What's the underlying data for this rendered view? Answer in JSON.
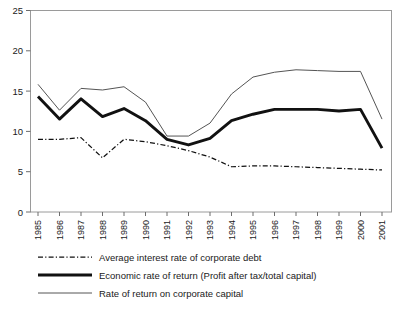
{
  "chart_data": {
    "type": "line",
    "title": "",
    "subtitle": "",
    "xlabel": "",
    "ylabel": "",
    "x": [
      1985,
      1986,
      1987,
      1988,
      1989,
      1990,
      1991,
      1992,
      1993,
      1994,
      1995,
      1996,
      1997,
      1998,
      1999,
      2000,
      2001
    ],
    "categories": [
      "1985",
      "1986",
      "1987",
      "1988",
      "1989",
      "1990",
      "1991",
      "1992",
      "1993",
      "1994",
      "1995",
      "1996",
      "1997",
      "1998",
      "1999",
      "2000",
      "2001"
    ],
    "xlim": [
      1985,
      2001
    ],
    "ylim": [
      0,
      25
    ],
    "yticks": [
      0,
      5,
      10,
      15,
      20,
      25
    ],
    "ytick_labels": [
      "0",
      "5",
      "10",
      "15",
      "20",
      "25"
    ],
    "grid": false,
    "legend_position": "below-axis",
    "series": [
      {
        "name": "Average interest rate of corporate debt",
        "style": "dash-dot",
        "width": "thin",
        "color": "#111111",
        "values": [
          9.0,
          9.0,
          9.2,
          6.7,
          9.0,
          8.7,
          8.2,
          7.6,
          6.8,
          5.6,
          5.7,
          5.7,
          5.6,
          5.5,
          5.4,
          5.3,
          5.2
        ]
      },
      {
        "name": "Economic rate of return (Profit after tax/total capital)",
        "style": "solid",
        "width": "thick",
        "color": "#111111",
        "values": [
          14.3,
          11.5,
          14.0,
          11.8,
          12.8,
          11.3,
          9.0,
          8.3,
          9.1,
          11.3,
          12.1,
          12.7,
          12.7,
          12.7,
          12.5,
          12.7,
          7.9
        ]
      },
      {
        "name": "Rate of return on corporate capital",
        "style": "solid",
        "width": "thin",
        "color": "#545454",
        "values": [
          15.8,
          12.6,
          15.3,
          15.1,
          15.5,
          13.6,
          9.4,
          9.4,
          11.0,
          14.6,
          16.7,
          17.3,
          17.6,
          17.5,
          17.4,
          17.4,
          11.5
        ]
      }
    ]
  },
  "legend": {
    "entries": [
      {
        "label": "Average interest rate of corporate debt",
        "swatch": "dash-dot-line-icon"
      },
      {
        "label": "Economic rate of return (Profit after tax/total capital)",
        "swatch": "thick-line-icon"
      },
      {
        "label": "Rate of return on corporate capital",
        "swatch": "thin-line-icon"
      }
    ]
  },
  "axes": {
    "y_tick_labels": [
      "25",
      "20",
      "15",
      "10",
      "5",
      "0"
    ],
    "x_tick_labels": [
      "1985",
      "1986",
      "1987",
      "1988",
      "1989",
      "1990",
      "1991",
      "1992",
      "1993",
      "1994",
      "1995",
      "1996",
      "1997",
      "1998",
      "1999",
      "2000",
      "2001"
    ]
  }
}
